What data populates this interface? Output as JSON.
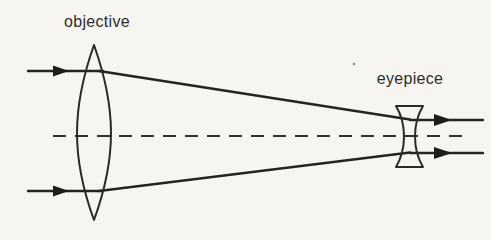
{
  "diagram": {
    "type": "optics-ray-diagram",
    "labels": {
      "objective": "objective",
      "eyepiece": "eyepiece"
    },
    "elements": {
      "objective_lens": "biconvex-converging-lens",
      "eyepiece_lens": "biconcave-diverging-lens",
      "optical_axis": "dashed-horizontal-centerline",
      "rays": [
        "top incoming parallel ray with right arrowhead",
        "bottom incoming parallel ray with right arrowhead",
        "top converging ray from objective to eyepiece",
        "bottom converging ray from objective to eyepiece",
        "top exiting parallel ray with right arrowhead",
        "bottom exiting parallel ray with right arrowhead"
      ]
    },
    "colors": {
      "ink": "#2b2a28",
      "background": "#f6f5f2"
    }
  }
}
